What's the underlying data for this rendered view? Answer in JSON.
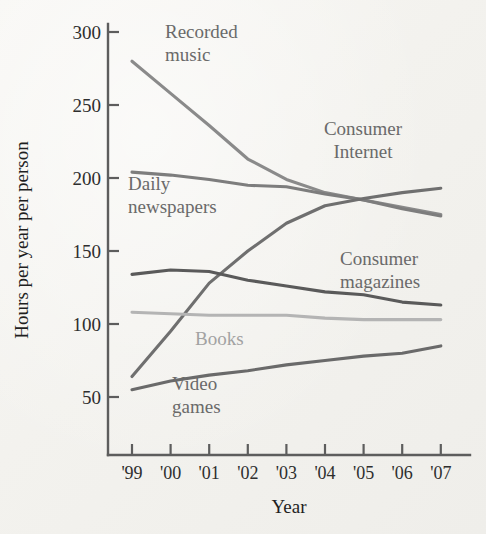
{
  "chart_data": {
    "type": "line",
    "title": "",
    "xlabel": "Year",
    "ylabel": "Hours per year per person",
    "x": [
      "'99",
      "'00",
      "'01",
      "'02",
      "'03",
      "'04",
      "'05",
      "'06",
      "'07"
    ],
    "xlim": [
      "'99",
      "'07"
    ],
    "ylim": [
      25,
      310
    ],
    "yticks": [
      50,
      100,
      150,
      200,
      250,
      300
    ],
    "ytick_labels": [
      "50",
      "100",
      "150",
      "200",
      "250",
      "300"
    ],
    "grid": false,
    "legend": "inline-labels",
    "series": [
      {
        "name": "Recorded music",
        "label": "Recorded music",
        "color": "#8a8a8a",
        "values": [
          280,
          258,
          236,
          213,
          199,
          190,
          185,
          180,
          175
        ]
      },
      {
        "name": "Daily newspapers",
        "label": "Daily newspapers",
        "color": "#7d7d7d",
        "values": [
          204,
          202,
          199,
          195,
          194,
          189,
          185,
          179,
          174
        ]
      },
      {
        "name": "Consumer Internet",
        "label": "Consumer Internet",
        "color": "#6f6f6f",
        "values": [
          64,
          95,
          128,
          150,
          169,
          181,
          186,
          190,
          193
        ]
      },
      {
        "name": "Consumer magazines",
        "label": "Consumer magazines",
        "color": "#5a5a5a",
        "values": [
          134,
          137,
          136,
          130,
          126,
          122,
          120,
          115,
          113
        ]
      },
      {
        "name": "Books",
        "label": "Books",
        "color": "#b4b4b4",
        "values": [
          108,
          107,
          106,
          106,
          106,
          104,
          103,
          103,
          103
        ]
      },
      {
        "name": "Video games",
        "label": "Video games",
        "color": "#6a6a6a",
        "values": [
          55,
          61,
          65,
          68,
          72,
          75,
          78,
          80,
          85
        ]
      }
    ],
    "series_label_positions": [
      {
        "name": "Recorded music",
        "x": 165,
        "y": 38,
        "lines": [
          "Recorded",
          "music"
        ],
        "tone": "dark"
      },
      {
        "name": "Daily newspapers",
        "x": 128,
        "y": 190,
        "lines": [
          "Daily",
          "newspapers"
        ],
        "tone": "dark"
      },
      {
        "name": "Consumer Internet",
        "x": 363,
        "y": 135,
        "lines": [
          "Consumer",
          "Internet"
        ],
        "tone": "dark",
        "align": "middle"
      },
      {
        "name": "Consumer magazines",
        "x": 340,
        "y": 265,
        "lines": [
          "Consumer",
          "magazines"
        ],
        "tone": "dark"
      },
      {
        "name": "Books",
        "x": 195,
        "y": 345,
        "lines": [
          "Books"
        ],
        "tone": "light"
      },
      {
        "name": "Video games",
        "x": 172,
        "y": 390,
        "lines": [
          "Video",
          "games"
        ],
        "tone": "dark"
      }
    ]
  },
  "axes": {
    "y_axis_title": "Hours per year per person",
    "x_axis_title": "Year"
  }
}
